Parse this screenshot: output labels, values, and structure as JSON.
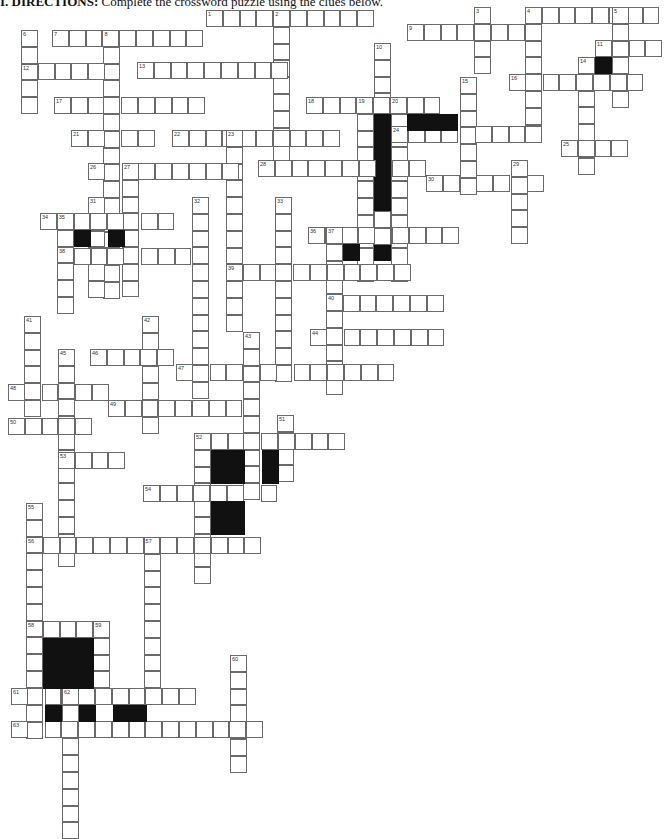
{
  "header": {
    "label": "I. DIRECTIONS:",
    "text": "Complete the crossword puzzle using the clues below."
  },
  "cell_size": 16.8,
  "colors": {
    "border": "#6a6a6a",
    "black": "#111111",
    "background": "#ffffff"
  },
  "words": [
    {
      "n": 1,
      "dir": "across",
      "x": 206,
      "y": 10,
      "len": 10
    },
    {
      "n": 2,
      "dir": "down",
      "x": 273,
      "y": 10,
      "len": 9
    },
    {
      "n": 3,
      "dir": "down",
      "x": 474,
      "y": 7,
      "len": 4
    },
    {
      "n": 4,
      "dir": "across",
      "x": 525,
      "y": 7,
      "len": 8
    },
    {
      "n": 4,
      "dir": "down",
      "x": 525,
      "y": 7,
      "len": 8
    },
    {
      "n": 5,
      "dir": "down",
      "x": 612,
      "y": 7,
      "len": 6
    },
    {
      "n": 6,
      "dir": "down",
      "x": 21,
      "y": 30,
      "len": 5
    },
    {
      "n": 7,
      "dir": "across",
      "x": 52,
      "y": 30,
      "len": 9
    },
    {
      "n": 8,
      "dir": "down",
      "x": 103,
      "y": 30,
      "len": 16
    },
    {
      "n": 9,
      "dir": "across",
      "x": 407,
      "y": 24,
      "len": 8
    },
    {
      "n": 10,
      "dir": "down",
      "x": 374,
      "y": 43,
      "len": 13
    },
    {
      "n": 11,
      "dir": "across",
      "x": 595,
      "y": 40,
      "len": 4
    },
    {
      "n": 12,
      "dir": "across",
      "x": 21,
      "y": 63,
      "len": 6
    },
    {
      "n": 13,
      "dir": "across",
      "x": 137,
      "y": 62,
      "len": 9
    },
    {
      "n": 14,
      "dir": "down",
      "x": 578,
      "y": 57,
      "len": 7
    },
    {
      "n": 15,
      "dir": "down",
      "x": 460,
      "y": 77,
      "len": 7
    },
    {
      "n": 16,
      "dir": "across",
      "x": 509,
      "y": 74,
      "len": 8
    },
    {
      "n": 17,
      "dir": "across",
      "x": 54,
      "y": 97,
      "len": 9
    },
    {
      "n": 18,
      "dir": "across",
      "x": 306,
      "y": 97,
      "len": 8
    },
    {
      "n": 19,
      "dir": "down",
      "x": 357,
      "y": 97,
      "len": 11
    },
    {
      "n": 20,
      "dir": "down",
      "x": 391,
      "y": 97,
      "len": 11
    },
    {
      "n": 21,
      "dir": "across",
      "x": 71,
      "y": 130,
      "len": 5
    },
    {
      "n": 22,
      "dir": "across",
      "x": 172,
      "y": 130,
      "len": 10
    },
    {
      "n": 23,
      "dir": "down",
      "x": 226,
      "y": 130,
      "len": 12
    },
    {
      "n": 24,
      "dir": "across",
      "x": 391,
      "y": 126,
      "len": 9
    },
    {
      "n": 25,
      "dir": "across",
      "x": 561,
      "y": 140,
      "len": 4
    },
    {
      "n": 26,
      "dir": "across",
      "x": 88,
      "y": 163,
      "len": 9
    },
    {
      "n": 27,
      "dir": "down",
      "x": 122,
      "y": 163,
      "len": 8
    },
    {
      "n": 28,
      "dir": "across",
      "x": 258,
      "y": 160,
      "len": 10
    },
    {
      "n": 29,
      "dir": "down",
      "x": 511,
      "y": 160,
      "len": 5
    },
    {
      "n": 30,
      "dir": "across",
      "x": 426,
      "y": 175,
      "len": 7
    },
    {
      "n": 31,
      "dir": "down",
      "x": 88,
      "y": 197,
      "len": 6
    },
    {
      "n": 32,
      "dir": "down",
      "x": 192,
      "y": 197,
      "len": 12
    },
    {
      "n": 33,
      "dir": "down",
      "x": 275,
      "y": 197,
      "len": 11
    },
    {
      "n": 34,
      "dir": "across",
      "x": 40,
      "y": 213,
      "len": 8
    },
    {
      "n": 35,
      "dir": "down",
      "x": 57,
      "y": 213,
      "len": 6
    },
    {
      "n": 36,
      "dir": "across",
      "x": 308,
      "y": 227,
      "len": 9
    },
    {
      "n": 37,
      "dir": "down",
      "x": 326,
      "y": 227,
      "len": 10
    },
    {
      "n": 38,
      "dir": "across",
      "x": 57,
      "y": 248,
      "len": 9
    },
    {
      "n": 39,
      "dir": "across",
      "x": 226,
      "y": 264,
      "len": 11
    },
    {
      "n": 40,
      "dir": "across",
      "x": 326,
      "y": 295,
      "len": 7
    },
    {
      "n": 41,
      "dir": "down",
      "x": 24,
      "y": 316,
      "len": 6
    },
    {
      "n": 42,
      "dir": "down",
      "x": 142,
      "y": 316,
      "len": 7
    },
    {
      "n": 43,
      "dir": "down",
      "x": 243,
      "y": 332,
      "len": 10
    },
    {
      "n": 44,
      "dir": "across",
      "x": 310,
      "y": 329,
      "len": 8
    },
    {
      "n": 45,
      "dir": "down",
      "x": 58,
      "y": 349,
      "len": 13
    },
    {
      "n": 46,
      "dir": "across",
      "x": 90,
      "y": 349,
      "len": 5
    },
    {
      "n": 47,
      "dir": "across",
      "x": 176,
      "y": 364,
      "len": 13
    },
    {
      "n": 48,
      "dir": "across",
      "x": 8,
      "y": 384,
      "len": 6
    },
    {
      "n": 49,
      "dir": "across",
      "x": 108,
      "y": 400,
      "len": 9
    },
    {
      "n": 50,
      "dir": "across",
      "x": 8,
      "y": 418,
      "len": 5
    },
    {
      "n": 51,
      "dir": "down",
      "x": 277,
      "y": 415,
      "len": 4
    },
    {
      "n": 52,
      "dir": "across",
      "x": 194,
      "y": 433,
      "len": 9
    },
    {
      "n": 52,
      "dir": "down",
      "x": 194,
      "y": 433,
      "len": 9
    },
    {
      "n": 53,
      "dir": "across",
      "x": 58,
      "y": 452,
      "len": 4
    },
    {
      "n": 54,
      "dir": "across",
      "x": 143,
      "y": 485,
      "len": 8
    },
    {
      "n": 55,
      "dir": "down",
      "x": 26,
      "y": 503,
      "len": 12
    },
    {
      "n": 56,
      "dir": "across",
      "x": 26,
      "y": 537,
      "len": 14
    },
    {
      "n": 57,
      "dir": "down",
      "x": 144,
      "y": 537,
      "len": 9
    },
    {
      "n": 58,
      "dir": "across",
      "x": 26,
      "y": 621,
      "len": 5
    },
    {
      "n": 58,
      "dir": "down",
      "x": 26,
      "y": 621,
      "len": 7
    },
    {
      "n": 59,
      "dir": "down",
      "x": 93,
      "y": 621,
      "len": 5
    },
    {
      "n": 60,
      "dir": "down",
      "x": 230,
      "y": 655,
      "len": 7
    },
    {
      "n": 61,
      "dir": "across",
      "x": 11,
      "y": 688,
      "len": 11
    },
    {
      "n": 62,
      "dir": "down",
      "x": 62,
      "y": 688,
      "len": 9
    },
    {
      "n": 63,
      "dir": "across",
      "x": 11,
      "y": 721,
      "len": 15
    }
  ],
  "black_cells": [
    [
      595,
      57
    ],
    [
      374,
      110
    ],
    [
      374,
      126
    ],
    [
      374,
      143
    ],
    [
      374,
      160
    ],
    [
      374,
      177
    ],
    [
      374,
      194
    ],
    [
      407,
      114
    ],
    [
      424,
      114
    ],
    [
      441,
      114
    ],
    [
      74,
      230
    ],
    [
      108,
      230
    ],
    [
      343,
      244
    ],
    [
      377,
      244
    ],
    [
      211,
      450
    ],
    [
      228,
      450
    ],
    [
      211,
      467
    ],
    [
      228,
      467
    ],
    [
      262,
      450
    ],
    [
      262,
      467
    ],
    [
      211,
      501
    ],
    [
      228,
      501
    ],
    [
      211,
      518
    ],
    [
      228,
      518
    ],
    [
      43,
      638
    ],
    [
      60,
      638
    ],
    [
      77,
      638
    ],
    [
      43,
      655
    ],
    [
      60,
      655
    ],
    [
      77,
      655
    ],
    [
      43,
      672
    ],
    [
      60,
      672
    ],
    [
      77,
      672
    ],
    [
      45,
      705
    ],
    [
      79,
      705
    ],
    [
      113,
      705
    ],
    [
      130,
      705
    ]
  ]
}
